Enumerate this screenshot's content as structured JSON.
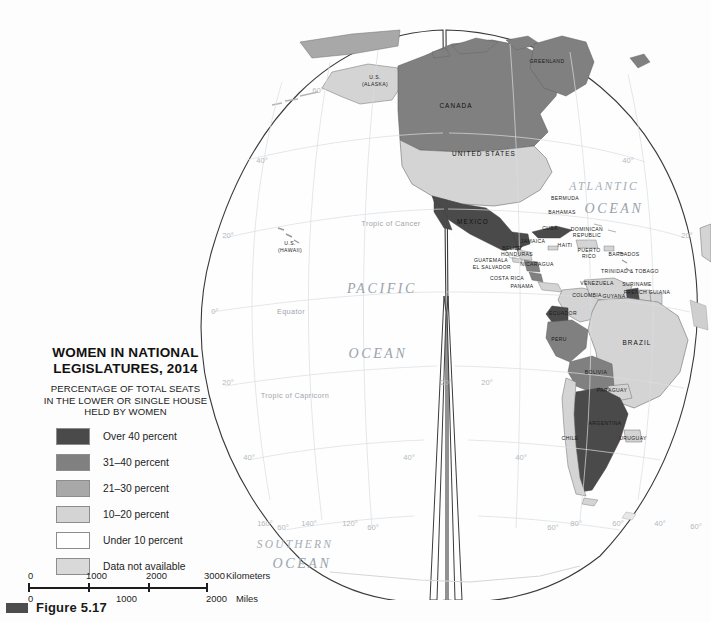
{
  "figure": {
    "caption": "Figure 5.17",
    "mark_color": "#4d4d4d"
  },
  "legend": {
    "title_line1": "WOMEN IN NATIONAL",
    "title_line2": "LEGISLATURES, 2014",
    "subtitle_line1": "PERCENTAGE OF TOTAL SEATS",
    "subtitle_line2": "IN THE LOWER OR SINGLE HOUSE",
    "subtitle_line3": "HELD BY WOMEN",
    "items": [
      {
        "label": "Over 40 percent",
        "color": "#4a4a4a"
      },
      {
        "label": "31–40 percent",
        "color": "#808080"
      },
      {
        "label": "21–30 percent",
        "color": "#a8a8a8"
      },
      {
        "label": "10–20 percent",
        "color": "#d4d4d4"
      },
      {
        "label": "Under 10 percent",
        "color": "#ffffff"
      },
      {
        "label": "Data not available",
        "color": "#d9d9d9"
      }
    ]
  },
  "scale": {
    "km": {
      "ticks": [
        "0",
        "1000",
        "2000",
        "3000"
      ],
      "unit": "Kilometers"
    },
    "miles": {
      "ticks": [
        "0",
        "1000",
        "2000"
      ],
      "unit": "Miles"
    }
  },
  "map": {
    "projection": "interrupted-goode-homolosine",
    "oceans": [
      {
        "name": "PACIFIC",
        "x": 382,
        "y": 293
      },
      {
        "name": "OCEAN",
        "x": 378,
        "y": 358
      },
      {
        "name": "ATLANTIC",
        "x": 604,
        "y": 190
      },
      {
        "name": "OCEAN",
        "x": 614,
        "y": 213
      },
      {
        "name": "SOUTHERN",
        "x": 295,
        "y": 548
      },
      {
        "name": "OCEAN",
        "x": 302,
        "y": 568
      }
    ],
    "reference_lines": [
      {
        "name": "Tropic of Cancer",
        "x": 391,
        "y": 226
      },
      {
        "name": "Equator",
        "x": 291,
        "y": 314
      },
      {
        "name": "Tropic of Capricorn",
        "x": 295,
        "y": 398
      }
    ],
    "graticule_labels": [
      {
        "text": "60°",
        "x": 318,
        "y": 93
      },
      {
        "text": "40°",
        "x": 262,
        "y": 163
      },
      {
        "text": "20°",
        "x": 228,
        "y": 238
      },
      {
        "text": "0°",
        "x": 215,
        "y": 314
      },
      {
        "text": "20°",
        "x": 228,
        "y": 385
      },
      {
        "text": "40°",
        "x": 249,
        "y": 460
      },
      {
        "text": "60°",
        "x": 283,
        "y": 530
      },
      {
        "text": "40°",
        "x": 628,
        "y": 163
      },
      {
        "text": "20°",
        "x": 687,
        "y": 238
      },
      {
        "text": "20°",
        "x": 446,
        "y": 385
      },
      {
        "text": "20°",
        "x": 487,
        "y": 385
      },
      {
        "text": "40°",
        "x": 409,
        "y": 460
      },
      {
        "text": "40°",
        "x": 521,
        "y": 460
      },
      {
        "text": "60°",
        "x": 373,
        "y": 530
      },
      {
        "text": "60°",
        "x": 553,
        "y": 530
      },
      {
        "text": "160°",
        "x": 265,
        "y": 526
      },
      {
        "text": "140°",
        "x": 309,
        "y": 526
      },
      {
        "text": "120°",
        "x": 350,
        "y": 526
      },
      {
        "text": "80°",
        "x": 576,
        "y": 526
      },
      {
        "text": "60°",
        "x": 618,
        "y": 526
      },
      {
        "text": "40°",
        "x": 660,
        "y": 526
      },
      {
        "text": "60°",
        "x": 696,
        "y": 529
      }
    ],
    "countries": [
      {
        "name": "GREENLAND",
        "x": 547,
        "y": 63,
        "size": "sm",
        "bucket": 1
      },
      {
        "name": "U.S.",
        "x": 375,
        "y": 79,
        "size": "sm",
        "bucket": 3
      },
      {
        "name": "(ALASKA)",
        "x": 375,
        "y": 86,
        "size": "sm",
        "bucket": 3
      },
      {
        "name": "CANADA",
        "x": 456,
        "y": 108,
        "size": "lg",
        "bucket": 2
      },
      {
        "name": "UNITED STATES",
        "x": 484,
        "y": 156,
        "size": "lg",
        "bucket": 3
      },
      {
        "name": "BERMUDA",
        "x": 565,
        "y": 200,
        "size": "sm",
        "bucket": 5
      },
      {
        "name": "MEXICO",
        "x": 473,
        "y": 224,
        "size": "lg",
        "bucket": 1
      },
      {
        "name": "BAHAMAS",
        "x": 562,
        "y": 214,
        "size": "sm",
        "bucket": 3
      },
      {
        "name": "CUBA",
        "x": 550,
        "y": 230,
        "size": "sm",
        "bucket": 3
      },
      {
        "name": "DOMINICAN",
        "x": 587,
        "y": 231,
        "size": "sm",
        "bucket": 5
      },
      {
        "name": "REPUBLIC",
        "x": 587,
        "y": 237,
        "size": "sm",
        "bucket": 5
      },
      {
        "name": "JAMAICA",
        "x": 533,
        "y": 243,
        "size": "sm",
        "bucket": 5
      },
      {
        "name": "HAITI",
        "x": 565,
        "y": 247,
        "size": "sm",
        "bucket": 5
      },
      {
        "name": "BELIZE",
        "x": 512,
        "y": 250,
        "size": "sm",
        "bucket": 5
      },
      {
        "name": "HONDURAS",
        "x": 517,
        "y": 256,
        "size": "sm",
        "bucket": 4
      },
      {
        "name": "PUERTO",
        "x": 589,
        "y": 252,
        "size": "sm",
        "bucket": 3
      },
      {
        "name": "RICO",
        "x": 589,
        "y": 258,
        "size": "sm",
        "bucket": 3
      },
      {
        "name": "GUATEMALA",
        "x": 491,
        "y": 262,
        "size": "sm",
        "bucket": 5
      },
      {
        "name": "EL SALVADOR",
        "x": 492,
        "y": 269,
        "size": "sm",
        "bucket": 3
      },
      {
        "name": "NICARAGUA",
        "x": 537,
        "y": 266,
        "size": "sm",
        "bucket": 2
      },
      {
        "name": "BARBADOS",
        "x": 624,
        "y": 256,
        "size": "sm",
        "bucket": 5
      },
      {
        "name": "COSTA RICA",
        "x": 507,
        "y": 280,
        "size": "sm",
        "bucket": 2
      },
      {
        "name": "PANAMA",
        "x": 522,
        "y": 288,
        "size": "sm",
        "bucket": 3
      },
      {
        "name": "TRINIDAD & TOBAGO",
        "x": 630,
        "y": 273,
        "size": "sm",
        "bucket": 3
      },
      {
        "name": "VENEZUELA",
        "x": 597,
        "y": 285,
        "size": "sm",
        "bucket": 3
      },
      {
        "name": "SURINAME",
        "x": 637,
        "y": 286,
        "size": "sm",
        "bucket": 3
      },
      {
        "name": "FRENCH GUIANA",
        "x": 647,
        "y": 294,
        "size": "sm",
        "bucket": 3
      },
      {
        "name": "COLOMBIA",
        "x": 587,
        "y": 297,
        "size": "sm",
        "bucket": 3
      },
      {
        "name": "GUYANA",
        "x": 614,
        "y": 298,
        "size": "sm",
        "bucket": 2
      },
      {
        "name": "ECUADOR",
        "x": 563,
        "y": 315,
        "size": "sm",
        "bucket": 1
      },
      {
        "name": "PERU",
        "x": 559,
        "y": 341,
        "size": "sm",
        "bucket": 2
      },
      {
        "name": "BRAZIL",
        "x": 637,
        "y": 345,
        "size": "lg",
        "bucket": 3
      },
      {
        "name": "BOLIVIA",
        "x": 596,
        "y": 374,
        "size": "sm",
        "bucket": 2
      },
      {
        "name": "PARAGUAY",
        "x": 612,
        "y": 392,
        "size": "sm",
        "bucket": 3
      },
      {
        "name": "ARGENTINA",
        "x": 605,
        "y": 425,
        "size": "sm",
        "bucket": 1
      },
      {
        "name": "CHILE",
        "x": 570,
        "y": 440,
        "size": "sm",
        "bucket": 3
      },
      {
        "name": "URUGUAY",
        "x": 633,
        "y": 440,
        "size": "sm",
        "bucket": 3
      },
      {
        "name": "U.S.",
        "x": 290,
        "y": 245,
        "size": "sm",
        "bucket": 3
      },
      {
        "name": "(HAWAII)",
        "x": 290,
        "y": 252,
        "size": "sm",
        "bucket": 3
      }
    ]
  }
}
